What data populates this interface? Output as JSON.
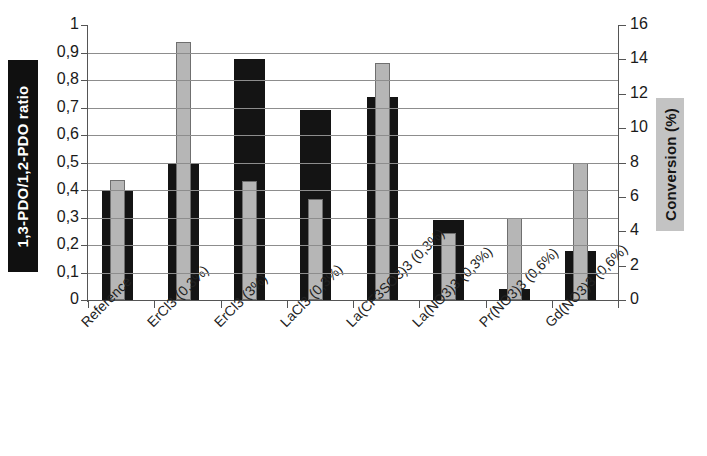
{
  "chart_data": {
    "type": "bar",
    "title": "",
    "subtitle": "",
    "xlabel": "",
    "ylabel": "1,3-PDO/1,2-PDO ratio",
    "y2label": "Conversion (%)",
    "grid": true,
    "legend": "none",
    "ylim": [
      0,
      1
    ],
    "y2lim": [
      0,
      16
    ],
    "yticks": [
      "0",
      "0,1",
      "0,2",
      "0,3",
      "0,4",
      "0,5",
      "0,6",
      "0,7",
      "0,8",
      "0,9",
      "1"
    ],
    "ytick_values": [
      0,
      0.1,
      0.2,
      0.3,
      0.4,
      0.5,
      0.6,
      0.7,
      0.8,
      0.9,
      1
    ],
    "y2ticks": [
      "0",
      "2",
      "4",
      "6",
      "8",
      "10",
      "12",
      "14",
      "16"
    ],
    "y2tick_values": [
      0,
      2,
      4,
      6,
      8,
      10,
      12,
      14,
      16
    ],
    "categories": [
      "Reference",
      "ErCl3 (0,3%)",
      "ErCl3 (3%)",
      "LaCl3 (0,3%)",
      "La(CF3SO3)3 (0,3%)",
      "La(NO3)3 (0,3%)",
      "Pr(NO3)3 (0,6%)",
      "Gd(NO3)3 (0,6%)"
    ],
    "series": [
      {
        "name": "1,3-PDO/1,2-PDO ratio",
        "axis": "left",
        "color": "#141414",
        "values": [
          0.4,
          0.5,
          0.875,
          0.69,
          0.74,
          0.29,
          0.04,
          0.18
        ]
      },
      {
        "name": "Conversion (%)",
        "axis": "right",
        "color": "#b6b6b6",
        "values": [
          7.0,
          15.0,
          6.9,
          5.9,
          13.8,
          3.9,
          4.8,
          8.0
        ]
      }
    ]
  }
}
